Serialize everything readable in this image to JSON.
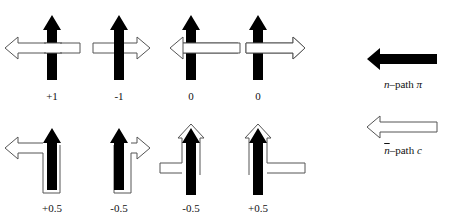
{
  "diagram": {
    "rows": [
      {
        "configs": [
          {
            "cx": 52,
            "label": "+1",
            "white": "left-cross"
          },
          {
            "cx": 119,
            "label": "-1",
            "white": "right-cross"
          },
          {
            "cx": 191,
            "label": "0",
            "white": "left-full"
          },
          {
            "cx": 258,
            "label": "0",
            "white": "right-full"
          }
        ]
      },
      {
        "configs": [
          {
            "cx": 52,
            "label": "+0.5",
            "white": "left-hook"
          },
          {
            "cx": 119,
            "label": "-0.5",
            "white": "right-hook"
          },
          {
            "cx": 191,
            "label": "-0.5",
            "white": "left-wrap"
          },
          {
            "cx": 258,
            "label": "+0.5",
            "white": "right-wrap"
          }
        ]
      }
    ],
    "legend": {
      "n_path": {
        "var": "n",
        "text": "–path ",
        "sym": "π"
      },
      "nbar_path": {
        "var": "n",
        "text": "–path ",
        "sym": "c"
      }
    }
  },
  "labels": {
    "r0c0": "+1",
    "r0c1": "-1",
    "r0c2": "0",
    "r0c3": "0",
    "r1c0": "+0.5",
    "r1c1": "-0.5",
    "r1c2": "-0.5",
    "r1c3": "+0.5"
  },
  "colors": {
    "black_arrow": "#000000",
    "white_arrow_fill": "#ffffff",
    "white_arrow_stroke": "#555555"
  }
}
